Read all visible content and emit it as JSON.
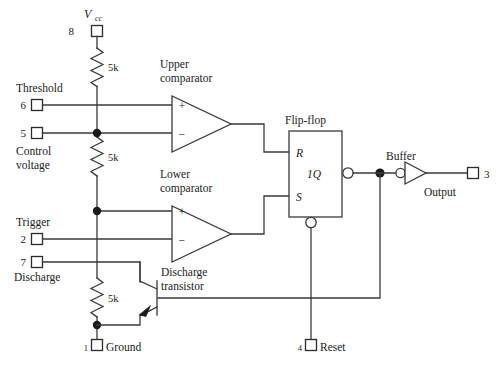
{
  "diagram": {
    "colors": {
      "wire": "#3a3a3a",
      "text": "#1a1a1a",
      "background": "#ffffff",
      "node": "#1a1a1a"
    },
    "supply": {
      "label_main": "V",
      "label_sub": "cc",
      "pin": "8"
    },
    "resistors": [
      {
        "id": "r-top",
        "value": "5k"
      },
      {
        "id": "r-mid",
        "value": "5k"
      },
      {
        "id": "r-bot",
        "value": "5k"
      }
    ],
    "terminals": [
      {
        "id": "threshold",
        "pin": "6",
        "name": "Threshold"
      },
      {
        "id": "control-voltage",
        "pin": "5",
        "name_line1": "Control",
        "name_line2": "voltage"
      },
      {
        "id": "trigger",
        "pin": "2",
        "name": "Trigger"
      },
      {
        "id": "discharge",
        "pin": "7",
        "name": "Discharge"
      },
      {
        "id": "ground",
        "pin": "1",
        "name": "Ground"
      },
      {
        "id": "reset",
        "pin": "4",
        "name": "Reset"
      },
      {
        "id": "output",
        "pin": "3",
        "name": "Output"
      }
    ],
    "comparators": [
      {
        "id": "upper-comparator",
        "label_line1": "Upper",
        "label_line2": "comparator",
        "plus": "+",
        "minus": "−"
      },
      {
        "id": "lower-comparator",
        "label_line1": "Lower",
        "label_line2": "comparator",
        "plus": "+",
        "minus": "−"
      }
    ],
    "flipflop": {
      "label": "Flip-flop",
      "input_r": "R",
      "input_s": "S",
      "output_q": "1Q"
    },
    "buffer": {
      "label": "Buffer"
    },
    "transistor": {
      "label_line1": "Discharge",
      "label_line2": "transistor"
    }
  }
}
